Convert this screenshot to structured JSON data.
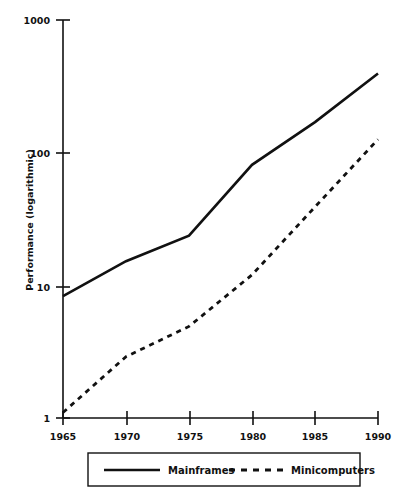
{
  "chart_data": {
    "type": "line",
    "title": "",
    "xlabel": "",
    "ylabel": "Performance (logarithmic)",
    "yscale": "log",
    "ylim": [
      1,
      1000
    ],
    "xlim": [
      1965,
      1990
    ],
    "grid": false,
    "legend_position": "bottom",
    "x": [
      1965,
      1970,
      1975,
      1980,
      1985,
      1990
    ],
    "xtick_labels": [
      "1965",
      "1970",
      "1975",
      "1980",
      "1985",
      "1990"
    ],
    "ytick_labels": [
      "1",
      "10",
      "100",
      "1000"
    ],
    "ytick_values": [
      1,
      10,
      100,
      1000
    ],
    "series": [
      {
        "name": "Mainframes",
        "style": "solid",
        "color": "#111111",
        "values": [
          8.3,
          15.2,
          23.7,
          81,
          170,
          395
        ]
      },
      {
        "name": "Minicomputers",
        "style": "dashed",
        "color": "#111111",
        "values": [
          1.1,
          2.9,
          4.9,
          12,
          39,
          126
        ]
      }
    ]
  },
  "legend": {
    "items": [
      {
        "label": "Mainframes",
        "style": "solid"
      },
      {
        "label": "Minicomputers",
        "style": "dashed"
      }
    ]
  },
  "axes": {
    "y_title": "Performance (logarithmic)",
    "y_ticks": [
      "1000",
      "100",
      "10",
      "1"
    ],
    "x_ticks": [
      "1965",
      "1970",
      "1975",
      "1980",
      "1985",
      "1990"
    ]
  }
}
